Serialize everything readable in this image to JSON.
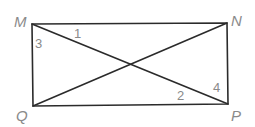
{
  "diagram": {
    "type": "geometry",
    "shape": "rectangle with diagonals",
    "vertices": [
      {
        "name": "M",
        "x": 32,
        "y": 24,
        "label_x": 14,
        "label_y": 27
      },
      {
        "name": "N",
        "x": 227,
        "y": 23,
        "label_x": 231,
        "label_y": 26
      },
      {
        "name": "P",
        "x": 228,
        "y": 104,
        "label_x": 231,
        "label_y": 121
      },
      {
        "name": "Q",
        "x": 33,
        "y": 106,
        "label_x": 16,
        "label_y": 121
      }
    ],
    "segments": [
      "MN",
      "NP",
      "PQ",
      "QM",
      "MP",
      "NQ"
    ],
    "angle_labels": [
      {
        "label": "1",
        "x": 74,
        "y": 38
      },
      {
        "label": "3",
        "x": 35,
        "y": 48
      },
      {
        "label": "2",
        "x": 177,
        "y": 100
      },
      {
        "label": "4",
        "x": 213,
        "y": 92
      }
    ],
    "colors": {
      "lines": "#2b2b2b",
      "labels": "#8a8a8a"
    }
  }
}
